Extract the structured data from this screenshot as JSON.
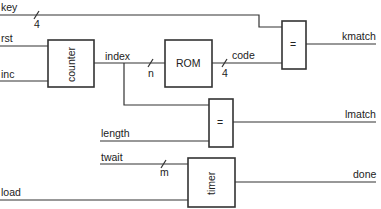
{
  "diagram": {
    "type": "block-diagram",
    "blocks": {
      "counter": {
        "label": "counter"
      },
      "rom": {
        "label": "ROM"
      },
      "eq_key": {
        "label": "="
      },
      "eq_length": {
        "label": "="
      },
      "timer": {
        "label": "timer"
      }
    },
    "signals": {
      "key": "key",
      "rst": "rst",
      "inc": "inc",
      "index": "index",
      "code": "code",
      "kmatch": "kmatch",
      "length": "length",
      "lmatch": "lmatch",
      "twait": "twait",
      "load": "load",
      "done": "done"
    },
    "bus_widths": {
      "key": "4",
      "index": "n",
      "code": "4",
      "twait": "m"
    }
  }
}
